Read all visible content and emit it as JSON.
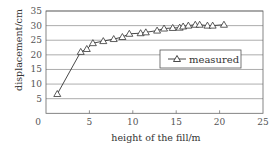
{
  "chart_data": {
    "type": "line",
    "title": "",
    "xlabel": "height of the fill/m",
    "ylabel": "displacement/cm",
    "xlim": [
      0,
      25
    ],
    "ylim": [
      0,
      35
    ],
    "xticks": [
      0,
      5,
      10,
      15,
      20,
      25
    ],
    "yticks": [
      5,
      10,
      15,
      20,
      25,
      30,
      35
    ],
    "grid": "horizontal",
    "legend_position": "inside-right-middle",
    "series": [
      {
        "name": "measured",
        "marker": "open-triangle",
        "color": "#333333",
        "x": [
          1.3,
          4.0,
          4.7,
          5.4,
          6.6,
          7.8,
          8.8,
          9.6,
          10.9,
          11.5,
          12.8,
          13.6,
          14.6,
          15.4,
          15.8,
          16.4,
          17.2,
          17.7,
          18.6,
          19.2,
          20.5
        ],
        "y": [
          6.6,
          21.0,
          22.0,
          24.0,
          24.7,
          25.4,
          26.1,
          27.2,
          27.4,
          27.7,
          28.3,
          29.0,
          29.2,
          29.3,
          29.7,
          30.0,
          30.3,
          30.3,
          30.0,
          30.0,
          30.3
        ]
      }
    ]
  },
  "legend": {
    "label": "measured"
  },
  "axes": {
    "x_title": "height of the fill/m",
    "y_title": "displacement/cm"
  }
}
